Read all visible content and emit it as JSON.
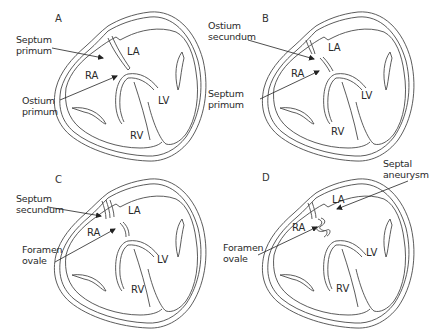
{
  "panels": [
    {
      "id": "A",
      "letter": "A",
      "chambers": {
        "la": "LA",
        "ra": "RA",
        "lv": "LV",
        "rv": "RV"
      },
      "annotations": [
        {
          "line1": "Septum",
          "line2": "primum"
        },
        {
          "line1": "Ostium",
          "line2": "primum"
        }
      ]
    },
    {
      "id": "B",
      "letter": "B",
      "chambers": {
        "la": "LA",
        "ra": "RA",
        "lv": "LV",
        "rv": "RV"
      },
      "annotations": [
        {
          "line1": "Ostium",
          "line2": "secundum"
        },
        {
          "line1": "Septum",
          "line2": "primum"
        }
      ]
    },
    {
      "id": "C",
      "letter": "C",
      "chambers": {
        "la": "LA",
        "ra": "RA",
        "lv": "LV",
        "rv": "RV"
      },
      "annotations": [
        {
          "line1": "Septum",
          "line2": "secundum"
        },
        {
          "line1": "Foramen",
          "line2": "ovale"
        }
      ]
    },
    {
      "id": "D",
      "letter": "D",
      "chambers": {
        "la": "LA",
        "ra": "RA",
        "lv": "LV",
        "rv": "RV"
      },
      "annotations": [
        {
          "line1": "Septal",
          "line2": "aneurysm"
        },
        {
          "line1": "Foramen",
          "line2": "ovale"
        }
      ]
    }
  ],
  "colors": {
    "outline": "#4a4a4a",
    "text": "#2a2a2a",
    "background": "#ffffff"
  }
}
